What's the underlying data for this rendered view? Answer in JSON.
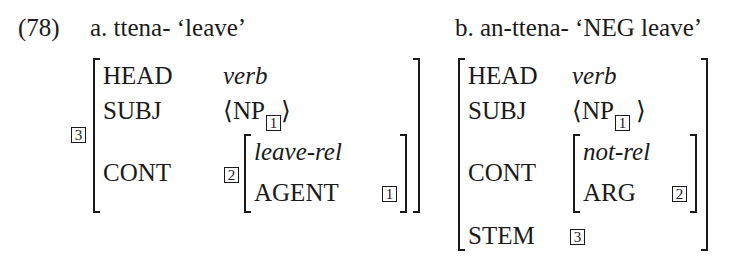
{
  "example_number": "(78)",
  "a": {
    "label": "a.",
    "form": "ttena-",
    "gloss": "‘leave’",
    "tag": "3",
    "rows": {
      "head": {
        "feature": "HEAD",
        "value": "verb"
      },
      "subj": {
        "feature": "SUBJ",
        "value_open": "⟨NP",
        "tag": "1",
        "value_close": "⟩"
      },
      "cont": {
        "feature": "CONT",
        "tag": "2",
        "type": "leave-rel",
        "attr": "AGENT",
        "attr_tag": "1"
      }
    }
  },
  "b": {
    "label": "b.",
    "form": "an-ttena-",
    "gloss": "‘NEG leave’",
    "rows": {
      "head": {
        "feature": "HEAD",
        "value": "verb"
      },
      "subj": {
        "feature": "SUBJ",
        "value_open": "⟨NP",
        "tag": "1",
        "value_close": "⟩"
      },
      "cont": {
        "feature": "CONT",
        "type": "not-rel",
        "attr": "ARG",
        "attr_tag": "2"
      },
      "stem": {
        "feature": "STEM",
        "tag": "3"
      }
    }
  }
}
